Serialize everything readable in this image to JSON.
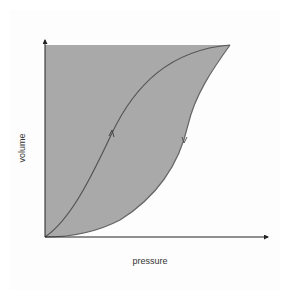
{
  "diagram": {
    "title": "",
    "type": "pressure-volume hysteresis loop",
    "axes": {
      "x_label": "pressure",
      "y_label": "volume"
    },
    "curves": [
      {
        "name": "inflation-curve",
        "description": "lower S-shaped curve from origin to top-right, arrow pointing up"
      },
      {
        "name": "deflation-curve",
        "description": "upper-left curve from top-right back to origin, arrow pointing down"
      }
    ],
    "colors": {
      "fill": "#a9a9a9",
      "curve": "#555555",
      "axis": "#222222",
      "label": "#333333",
      "background": "#ffffff"
    }
  }
}
